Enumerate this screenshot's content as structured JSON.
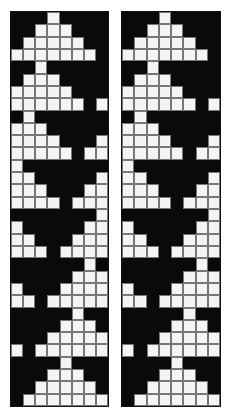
{
  "figure": {
    "columns": 8,
    "rows": 32,
    "colors": {
      "filled": "#0a0a0a",
      "empty": "#f4f4f4",
      "gridline": "#777777"
    },
    "encoding": "1 = black cell, 0 = white cell",
    "panels": [
      {
        "name": "left-pattern",
        "rows": [
          "11101111",
          "11000111",
          "10000011",
          "00000001",
          "11011111",
          "10001111",
          "00000111",
          "00000010",
          "10111111",
          "00011111",
          "00001110",
          "00000100",
          "01111111",
          "00111110",
          "00011100",
          "00001000",
          "11111110",
          "01111100",
          "00111000",
          "00010000",
          "11111101",
          "11111000",
          "01110000",
          "00100000",
          "11111011",
          "11110001",
          "11100000",
          "01000000",
          "11110111",
          "11100011",
          "11000001",
          "10000000"
        ]
      },
      {
        "name": "right-pattern",
        "rows": [
          "11101111",
          "11000111",
          "10000011",
          "00000001",
          "11011111",
          "10001111",
          "00000111",
          "00000010",
          "10111111",
          "00011111",
          "00001110",
          "00000100",
          "01111111",
          "00111110",
          "00011100",
          "00001000",
          "11111110",
          "01111100",
          "00111000",
          "00010000",
          "11111101",
          "11111000",
          "01110000",
          "00100000",
          "11111011",
          "11110001",
          "11100000",
          "01000000",
          "11110111",
          "11100011",
          "11000001",
          "10000000"
        ]
      }
    ]
  }
}
